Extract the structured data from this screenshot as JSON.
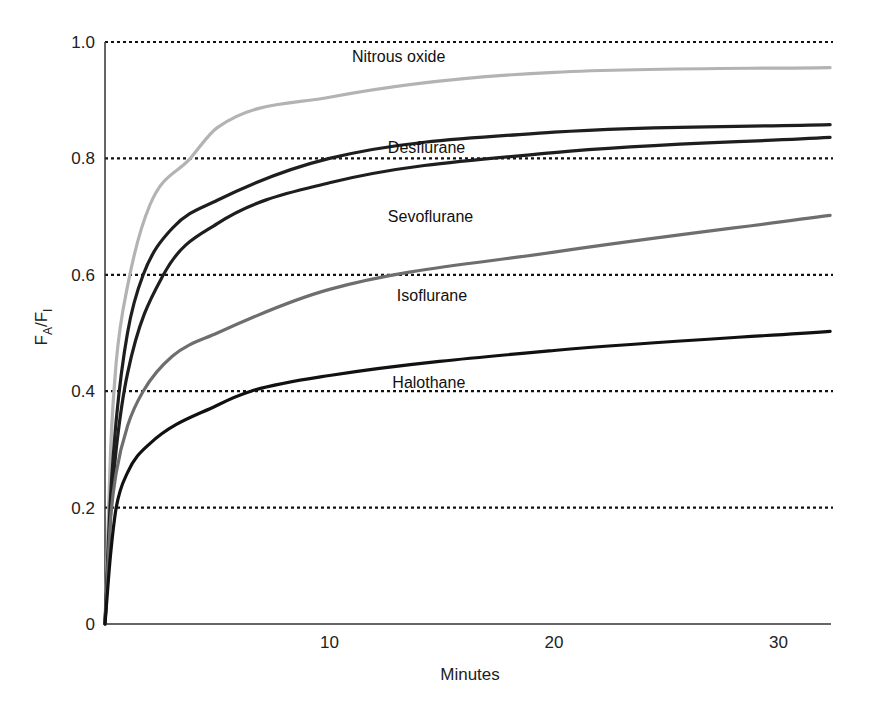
{
  "chart_data": {
    "type": "line",
    "title": "",
    "xlabel": "Minutes",
    "ylabel": "FA/FI",
    "ylabel_parts": {
      "main1": "F",
      "sub1": "A",
      "slash": "/",
      "main2": "F",
      "sub2": "I"
    },
    "xlim": [
      0,
      32.3
    ],
    "ylim": [
      0,
      1.0
    ],
    "x_ticks": [
      {
        "value": 10,
        "label": "10"
      },
      {
        "value": 20,
        "label": "20"
      },
      {
        "value": 30,
        "label": "30"
      }
    ],
    "y_ticks": [
      {
        "value": 0,
        "label": "0"
      },
      {
        "value": 0.2,
        "label": "0.2"
      },
      {
        "value": 0.4,
        "label": "0.4"
      },
      {
        "value": 0.6,
        "label": "0.6"
      },
      {
        "value": 0.8,
        "label": "0.8"
      },
      {
        "value": 1.0,
        "label": "1.0"
      }
    ],
    "grid": {
      "horizontal_dotted": [
        0.2,
        0.4,
        0.6,
        0.8,
        1.0
      ],
      "vertical": false
    },
    "legend": "inline labels",
    "series": [
      {
        "name": "Nitrous oxide",
        "color": "#b3b3b3",
        "label_pos": {
          "x": 11.0,
          "y": 0.965
        },
        "x": [
          0,
          0.25,
          0.5,
          1,
          2,
          3.8,
          5,
          10,
          20,
          32.3
        ],
        "values": [
          0,
          0.3,
          0.45,
          0.58,
          0.72,
          0.8,
          0.853,
          0.905,
          0.948,
          0.956
        ]
      },
      {
        "name": "Desflurane",
        "color": "#1e1e1e",
        "label_pos": {
          "x": 12.6,
          "y": 0.81
        },
        "x": [
          0,
          0.25,
          0.5,
          1,
          1.7,
          3,
          5,
          10,
          20,
          32.3
        ],
        "values": [
          0,
          0.22,
          0.35,
          0.5,
          0.6,
          0.68,
          0.728,
          0.8,
          0.845,
          0.858
        ]
      },
      {
        "name": "Sevoflurane",
        "color": "#1e1e1e",
        "label_pos": {
          "x": 12.6,
          "y": 0.69
        },
        "x": [
          0,
          0.25,
          0.5,
          1,
          2.6,
          5,
          10,
          20,
          32.3
        ],
        "values": [
          0,
          0.19,
          0.3,
          0.43,
          0.6,
          0.688,
          0.758,
          0.81,
          0.836
        ]
      },
      {
        "name": "Isoflurane",
        "color": "#6e6e6e",
        "label_pos": {
          "x": 13.0,
          "y": 0.555
        },
        "x": [
          0,
          0.25,
          0.5,
          1,
          1.7,
          3,
          5,
          10,
          20,
          32.3
        ],
        "values": [
          0,
          0.18,
          0.26,
          0.34,
          0.4,
          0.46,
          0.5,
          0.575,
          0.639,
          0.702
        ]
      },
      {
        "name": "Halothane",
        "color": "#111111",
        "label_pos": {
          "x": 12.8,
          "y": 0.405
        },
        "x": [
          0,
          0.25,
          0.5,
          1,
          2,
          5,
          6.5,
          10,
          20,
          32.3
        ],
        "values": [
          0,
          0.12,
          0.2,
          0.26,
          0.31,
          0.376,
          0.4,
          0.427,
          0.47,
          0.503
        ]
      }
    ]
  }
}
